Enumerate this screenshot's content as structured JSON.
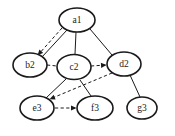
{
  "diagram": {
    "background_color": "#ffffff",
    "stroke_color": "#1a1a1a",
    "node_stroke_width": 1.6,
    "edge_stroke_width": 1.0,
    "canvas": {
      "width": 175,
      "height": 136
    },
    "nodes": [
      {
        "id": "a1",
        "label": "a1",
        "cx": 77,
        "cy": 20,
        "rx": 18,
        "ry": 12
      },
      {
        "id": "b2",
        "label": "b2",
        "cx": 30,
        "cy": 65,
        "rx": 17,
        "ry": 12
      },
      {
        "id": "c2",
        "label": "c2",
        "cx": 74,
        "cy": 67,
        "rx": 17,
        "ry": 12.5
      },
      {
        "id": "d2",
        "label": "d2",
        "cx": 124,
        "cy": 64,
        "rx": 17,
        "ry": 12
      },
      {
        "id": "e3",
        "label": "e3",
        "cx": 37,
        "cy": 108,
        "rx": 17,
        "ry": 12
      },
      {
        "id": "f3",
        "label": "f3",
        "cx": 95,
        "cy": 108,
        "rx": 18,
        "ry": 12
      },
      {
        "id": "g3",
        "label": "g3",
        "cx": 142,
        "cy": 108,
        "rx": 15,
        "ry": 11
      }
    ],
    "edges": [
      {
        "from": "a1",
        "to": "b2",
        "style": "solid",
        "arrow": false,
        "x1": 67,
        "y1": 30,
        "x2": 42,
        "y2": 57
      },
      {
        "from": "a1",
        "to": "b2",
        "style": "dashed",
        "arrow": true,
        "x1": 62,
        "y1": 28,
        "x2": 38,
        "y2": 55
      },
      {
        "from": "a1",
        "to": "c2",
        "style": "solid",
        "arrow": false,
        "x1": 76,
        "y1": 32,
        "x2": 75,
        "y2": 54
      },
      {
        "from": "a1",
        "to": "d2",
        "style": "solid",
        "arrow": false,
        "x1": 90,
        "y1": 29,
        "x2": 112,
        "y2": 55
      },
      {
        "from": "b2",
        "to": "c2",
        "style": "dashed",
        "arrow": false,
        "x1": 47,
        "y1": 65,
        "x2": 57,
        "y2": 66
      },
      {
        "from": "c2",
        "to": "d2",
        "style": "dashed",
        "arrow": true,
        "x1": 91,
        "y1": 66,
        "x2": 106,
        "y2": 65
      },
      {
        "from": "c2",
        "to": "e3",
        "style": "solid",
        "arrow": false,
        "x1": 66,
        "y1": 79,
        "x2": 46,
        "y2": 98
      },
      {
        "from": "c2",
        "to": "f3",
        "style": "solid",
        "arrow": false,
        "x1": 80,
        "y1": 80,
        "x2": 91,
        "y2": 96
      },
      {
        "from": "d2",
        "to": "e3",
        "style": "dashed",
        "arrow": true,
        "x1": 112,
        "y1": 73,
        "x2": 50,
        "y2": 99
      },
      {
        "from": "e3",
        "to": "f3",
        "style": "dashed",
        "arrow": true,
        "x1": 55,
        "y1": 108,
        "x2": 76,
        "y2": 108
      },
      {
        "from": "d2",
        "to": "g3",
        "style": "solid",
        "arrow": false,
        "x1": 130,
        "y1": 75,
        "x2": 140,
        "y2": 97
      }
    ]
  }
}
